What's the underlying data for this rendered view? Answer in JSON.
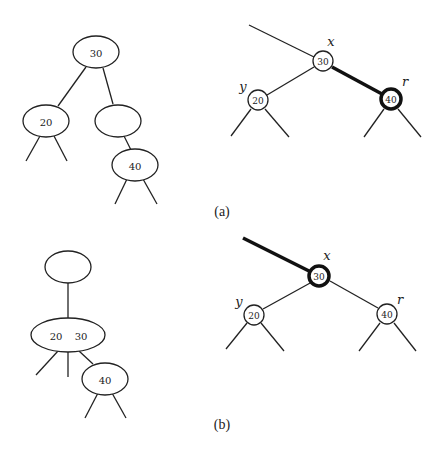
{
  "figure": {
    "panel_a": {
      "caption": "(a)",
      "left_tree": {
        "root_key": "30",
        "left_child_key": "20",
        "right_child_key": "",
        "right_grandchild_key": "40"
      },
      "right_tree": {
        "x_label": "x",
        "x_key": "30",
        "y_label": "y",
        "y_key": "20",
        "r_label": "r",
        "r_key": "40"
      }
    },
    "panel_b": {
      "caption": "(b)",
      "left_tree": {
        "root_key": "",
        "merged_keys": [
          "20",
          "30"
        ],
        "child_key": "40"
      },
      "right_tree": {
        "x_label": "x",
        "x_key": "30",
        "y_label": "y",
        "y_key": "20",
        "r_label": "r",
        "r_key": "40"
      }
    }
  }
}
